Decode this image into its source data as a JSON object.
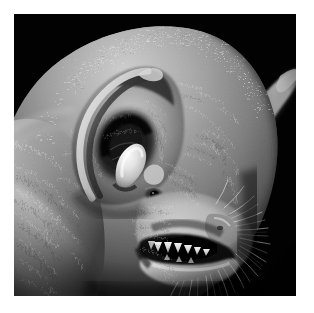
{
  "image": {
    "domain": "Natural-Image",
    "subject": "bat-head-profile",
    "description": "Black and white close-up photograph of a bat's head in three-quarter profile facing right, showing a large rounded ear with visible tragus, a small dark eye, bristled snout with whiskers and an open mouth revealing teeth.",
    "orientation": "square",
    "color_mode": "grayscale",
    "caption_text": "",
    "border": {
      "style": "white-mat",
      "width_px": 14,
      "color": "#ffffff"
    },
    "canvas": {
      "width_px": 314,
      "height_px": 313
    },
    "photo": {
      "left_px": 14,
      "top_px": 14,
      "width_px": 282,
      "height_px": 282
    }
  },
  "palette": {
    "background_black": "#010101",
    "deep_shadow": "#0a0a0a",
    "mid_shadow": "#3a3a3a",
    "fur_mid": "#7d7d7d",
    "fur_light": "#b9b9b9",
    "highlight": "#e8e8e8",
    "specular": "#fdfdfd",
    "mat_white": "#ffffff"
  },
  "subject_parts": [
    {
      "id": "head-dome",
      "label": "Head crown with spiky fur",
      "tone": "#8d8d8d"
    },
    {
      "id": "near-ear",
      "label": "Large near ear (left)",
      "tone": "#a2a2a2"
    },
    {
      "id": "ear-rim",
      "label": "Dark ear rim / antitragus fold",
      "tone": "#262626"
    },
    {
      "id": "tragus",
      "label": "Bright pointed tragus",
      "tone": "#efefef"
    },
    {
      "id": "ear-bowl",
      "label": "Shadowed ear concha bowl",
      "tone": "#1b1b1b"
    },
    {
      "id": "far-ear",
      "label": "Far ear pointing right",
      "tone": "#6f6f6f"
    },
    {
      "id": "eye",
      "label": "Small dark eye",
      "tone": "#070707"
    },
    {
      "id": "cheek",
      "label": "Cheek fur mass",
      "tone": "#9a9a9a"
    },
    {
      "id": "muzzle",
      "label": "Snout / muzzle",
      "tone": "#a8a8a8"
    },
    {
      "id": "nose-pad",
      "label": "Nose pad",
      "tone": "#7a7a7a"
    },
    {
      "id": "mouth",
      "label": "Open mouth cavity",
      "tone": "#050505"
    },
    {
      "id": "teeth",
      "label": "Exposed teeth",
      "tone": "#e2e2e2"
    },
    {
      "id": "lower-jaw",
      "label": "Lower jaw / chin",
      "tone": "#c0c0c0"
    },
    {
      "id": "whiskers",
      "label": "Muzzle whiskers and bristles",
      "tone": "#d6d6d6"
    },
    {
      "id": "neck-fur",
      "label": "Neck and shoulder fur",
      "tone": "#8a8a8a"
    }
  ]
}
